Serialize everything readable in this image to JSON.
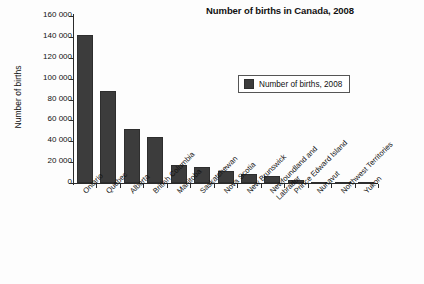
{
  "chart_data": {
    "type": "bar",
    "title": "Number of births in Canada, 2008",
    "xlabel": "",
    "ylabel": "Number of births",
    "ylim": [
      0,
      160000
    ],
    "ytick_step": 20000,
    "grid": false,
    "legend_position": "upper-right-inside",
    "legend": [
      "Number of births, 2008"
    ],
    "categories": [
      "Ontario",
      "Quebec",
      "Alberta",
      "British Columbia",
      "Manitoba",
      "Saskatchewan",
      "Nova Scotia",
      "New Brunswick",
      "Newfoundland and\nLabrador",
      "Prince Edward Island",
      "Nunavut",
      "Northwest Territories",
      "Yukon"
    ],
    "values": [
      141700,
      87900,
      51800,
      44400,
      17500,
      15700,
      11100,
      9100,
      6900,
      2900,
      1100,
      900,
      600
    ],
    "ytick_labels": [
      "0",
      "20 000",
      "40 000",
      "60 000",
      "80 000",
      "100 000",
      "120 000",
      "140 000",
      "160 000"
    ],
    "ytick_values": [
      0,
      20000,
      40000,
      60000,
      80000,
      100000,
      120000,
      140000,
      160000
    ],
    "series": [
      {
        "name": "Number of births, 2008",
        "values": [
          141700,
          87900,
          51800,
          44400,
          17500,
          15700,
          11100,
          9100,
          6900,
          2900,
          1100,
          900,
          600
        ]
      }
    ],
    "colors": {
      "bar": "#3c3c3c",
      "axis": "#2b2b2b",
      "text": "#111111",
      "background": "#fdfdfd"
    }
  }
}
